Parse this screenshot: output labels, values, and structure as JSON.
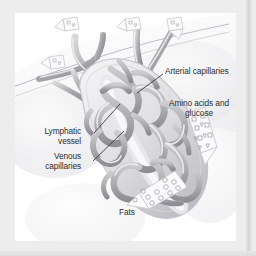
{
  "figure": {
    "kind": "anatomical-illustration",
    "style": "grayscale pencil rendering on white plate",
    "plate_background": "#ffffff",
    "mat_background": "#ededee",
    "ink_color": "#2c2c2e"
  },
  "labels": {
    "arterial_capillaries": "Arterial capillaries",
    "amino_acids_line1": "Amino acids and",
    "amino_acids_line2": "glucose",
    "lymphatic_line1": "Lymphatic",
    "lymphatic_line2": "vessel",
    "venous_line1": "Venous",
    "venous_line2": "capillaries",
    "fats": "Fats"
  },
  "callouts": [
    {
      "name": "arterial-capillaries",
      "text": "Arterial capillaries",
      "text_x": 165,
      "text_y": 66,
      "leader_from": [
        163,
        74
      ],
      "leader_to": [
        137,
        93
      ]
    },
    {
      "name": "lymphatic-vessel",
      "text": "Lymphatic vessel",
      "text_x": 40,
      "text_y": 128,
      "leader_from": [
        94,
        133
      ],
      "leader_to": [
        120,
        104
      ]
    },
    {
      "name": "venous-capillaries",
      "text": "Venous capillaries",
      "text_x": 33,
      "text_y": 152,
      "leader_from": [
        93,
        161
      ],
      "leader_to": [
        124,
        131
      ]
    },
    {
      "name": "amino-acids-and-glucose",
      "text": "Amino acids and glucose",
      "text_x": 178,
      "text_y": 98
    },
    {
      "name": "fats",
      "text": "Fats",
      "text_x": 119,
      "text_y": 208
    }
  ],
  "molecule_arrows": [
    {
      "name": "amino-acid-glucose-arrow",
      "particles": [
        "square",
        "triangle",
        "square",
        "triangle",
        "square",
        "triangle"
      ],
      "direction": "down-right",
      "count": 9
    },
    {
      "name": "fats-arrow",
      "particles": [
        "circle"
      ],
      "direction": "down-left",
      "count": 12
    },
    {
      "name": "top-left-molecule-1",
      "particles": [
        "square",
        "triangle"
      ],
      "direction": "up-left"
    },
    {
      "name": "top-left-molecule-2",
      "particles": [
        "square",
        "triangle"
      ],
      "direction": "up"
    },
    {
      "name": "top-left-molecule-3",
      "particles": [
        "square",
        "triangle"
      ],
      "direction": "up-right"
    },
    {
      "name": "top-left-molecule-4",
      "particles": [
        "square",
        "triangle"
      ],
      "direction": "left"
    }
  ],
  "structures": [
    {
      "name": "villus-body",
      "description": "elongated oval villus outlined in light gray"
    },
    {
      "name": "capillary-network",
      "description": "dense looping vessel mesh filling the villus"
    },
    {
      "name": "lymphatic-lacteal",
      "description": "central pale vessel running the villus axis"
    },
    {
      "name": "feeding-vessels",
      "description": "branching vessels entering from upper left"
    },
    {
      "name": "tissue-surface",
      "description": "diagonal mucosal surface line across upper area"
    }
  ]
}
